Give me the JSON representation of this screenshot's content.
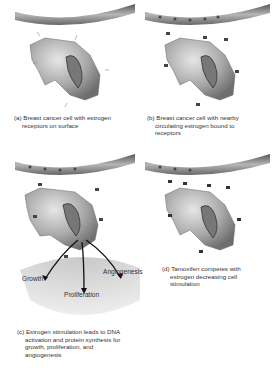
{
  "panels": [
    {
      "id": "a",
      "caption_lines": [
        "(a) Breast cancer cell with estrogen",
        "receptors on surface"
      ]
    },
    {
      "id": "b",
      "caption_lines": [
        "(b) Breast cancer cell with nearby",
        "circulating estrogen bound to",
        "receptors"
      ]
    },
    {
      "id": "c",
      "caption_lines": [
        "(c) Estrogen stimulation leads to DNA",
        "activation and protein synthesis for",
        "growth, proliferation, and",
        "angiogenesis"
      ],
      "outcomes": [
        "Growth",
        "Proliferation",
        "Angiogenesis"
      ]
    },
    {
      "id": "d",
      "caption_lines": [
        "(d) Tamoxifen competes with",
        "estrogen decreasing cell",
        "stimulation"
      ]
    }
  ],
  "colors": {
    "cell": "#9a9a9a",
    "nucleus": "#555555",
    "vessel": "#7a7a7a",
    "fan": "#dcdcdc"
  }
}
